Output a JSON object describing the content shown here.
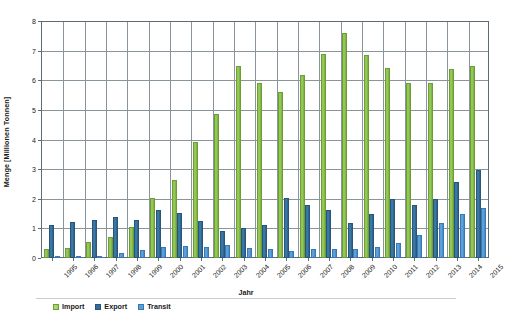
{
  "chart_data": {
    "type": "bar",
    "title": "",
    "subtitle": "",
    "xlabel": "Jahr",
    "ylabel": "Menge [Millionen Tonnen]",
    "ylim": [
      0,
      8
    ],
    "ytick_step": 1,
    "yticks": [
      "8",
      "7",
      "6",
      "5",
      "4",
      "3",
      "2",
      "1",
      "0"
    ],
    "grid": "horizontal-and-vertical",
    "legend_position": "bottom-left",
    "categories": [
      "1995",
      "1996",
      "1997",
      "1998",
      "1999",
      "2000",
      "2001",
      "2002",
      "2003",
      "2004",
      "2005",
      "2006",
      "2007",
      "2008",
      "2009",
      "2010",
      "2011",
      "2012",
      "2013",
      "2014",
      "2015"
    ],
    "series": [
      {
        "name": "Import",
        "color": "#8cc04e",
        "values": [
          0.3,
          0.35,
          0.55,
          0.72,
          1.05,
          2.02,
          2.65,
          3.93,
          4.85,
          6.48,
          5.9,
          5.6,
          6.18,
          6.88,
          7.58,
          6.85,
          6.43,
          5.9,
          5.9,
          6.38,
          6.47
        ]
      },
      {
        "name": "Export",
        "color": "#336e9b",
        "values": [
          1.1,
          1.22,
          1.29,
          1.38,
          1.29,
          1.63,
          1.53,
          1.25,
          0.92,
          1.0,
          1.1,
          2.02,
          1.8,
          1.61,
          1.18,
          1.5,
          1.98,
          1.78,
          2.0,
          2.58,
          2.98
        ]
      },
      {
        "name": "Transit",
        "color": "#4e96d4",
        "values": [
          0.02,
          0.03,
          0.07,
          0.18,
          0.27,
          0.38,
          0.42,
          0.37,
          0.43,
          0.34,
          0.32,
          0.25,
          0.3,
          0.3,
          0.3,
          0.38,
          0.52,
          0.78,
          1.17,
          1.48,
          1.68
        ]
      }
    ]
  },
  "axes": {
    "y_title": "Menge [Millionen Tonnen]",
    "x_title": "Jahr"
  },
  "legend": {
    "items": [
      {
        "label": "Import",
        "color": "#8cc04e"
      },
      {
        "label": "Export",
        "color": "#336e9b"
      },
      {
        "label": "Transit",
        "color": "#4e96d4"
      }
    ]
  }
}
